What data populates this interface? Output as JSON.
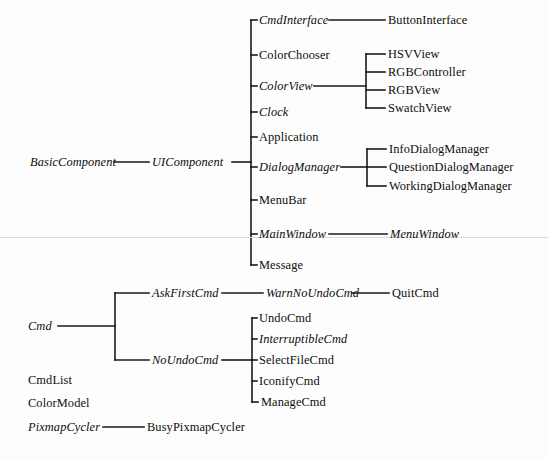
{
  "diagram": {
    "line_color": "#1a1a1a",
    "text_color": "#0d0d0d",
    "background": "#fdfdfd",
    "artifact_line_color": "#d9d9d9"
  },
  "nodes": {
    "basic_component": {
      "label": "BasicComponent",
      "style": "abstract",
      "x": 30,
      "y": 162
    },
    "ui_component": {
      "label": "UIComponent",
      "style": "abstract",
      "x": 152,
      "y": 162
    },
    "cmd_interface": {
      "label": "CmdInterface",
      "style": "abstract",
      "x": 259,
      "y": 20
    },
    "button_interface": {
      "label": "ButtonInterface",
      "style": "concrete",
      "x": 388,
      "y": 20
    },
    "color_chooser": {
      "label": "ColorChooser",
      "style": "concrete",
      "x": 259,
      "y": 55
    },
    "color_view": {
      "label": "ColorView",
      "style": "abstract",
      "x": 259,
      "y": 86
    },
    "hsv_view": {
      "label": "HSVView",
      "style": "concrete",
      "x": 388,
      "y": 54
    },
    "rgb_controller": {
      "label": "RGBController",
      "style": "concrete",
      "x": 388,
      "y": 72
    },
    "rgb_view": {
      "label": "RGBView",
      "style": "concrete",
      "x": 388,
      "y": 90
    },
    "swatch_view": {
      "label": "SwatchView",
      "style": "concrete",
      "x": 388,
      "y": 108
    },
    "clock": {
      "label": "Clock",
      "style": "abstract",
      "x": 259,
      "y": 112
    },
    "application": {
      "label": "Application",
      "style": "concrete",
      "x": 259,
      "y": 137
    },
    "dialog_manager": {
      "label": "DialogManager",
      "style": "abstract",
      "x": 259,
      "y": 167
    },
    "info_dialog_manager": {
      "label": "InfoDialogManager",
      "style": "concrete",
      "x": 389,
      "y": 149
    },
    "question_dialog_manager": {
      "label": "QuestionDialogManager",
      "style": "concrete",
      "x": 389,
      "y": 167
    },
    "working_dialog_manager": {
      "label": "WorkingDialogManager",
      "style": "concrete",
      "x": 389,
      "y": 186
    },
    "menu_bar": {
      "label": "MenuBar",
      "style": "concrete",
      "x": 259,
      "y": 200
    },
    "main_window": {
      "label": "MainWindow",
      "style": "abstract",
      "x": 259,
      "y": 234
    },
    "menu_window": {
      "label": "MenuWindow",
      "style": "abstract",
      "x": 390,
      "y": 234
    },
    "message": {
      "label": "Message",
      "style": "concrete",
      "x": 259,
      "y": 265
    },
    "cmd": {
      "label": "Cmd",
      "style": "abstract",
      "x": 28,
      "y": 326
    },
    "ask_first_cmd": {
      "label": "AskFirstCmd",
      "style": "abstract",
      "x": 152,
      "y": 293
    },
    "warn_no_undo_cmd": {
      "label": "WarnNoUndoCmd",
      "style": "abstract",
      "x": 266,
      "y": 293
    },
    "quit_cmd": {
      "label": "QuitCmd",
      "style": "concrete",
      "x": 392,
      "y": 293
    },
    "no_undo_cmd": {
      "label": "NoUndoCmd",
      "style": "abstract",
      "x": 152,
      "y": 360
    },
    "undo_cmd": {
      "label": "UndoCmd",
      "style": "concrete",
      "x": 259,
      "y": 318
    },
    "interruptible_cmd": {
      "label": "InterruptibleCmd",
      "style": "abstract",
      "x": 259,
      "y": 339
    },
    "select_file_cmd": {
      "label": "SelectFileCmd",
      "style": "concrete",
      "x": 259,
      "y": 360
    },
    "iconify_cmd": {
      "label": "IconifyCmd",
      "style": "concrete",
      "x": 259,
      "y": 381
    },
    "manage_cmd": {
      "label": "ManageCmd",
      "style": "concrete",
      "x": 261,
      "y": 402
    },
    "cmd_list": {
      "label": "CmdList",
      "style": "concrete",
      "x": 28,
      "y": 380
    },
    "color_model": {
      "label": "ColorModel",
      "style": "concrete",
      "x": 28,
      "y": 403
    },
    "pixmap_cycler": {
      "label": "PixmapCycler",
      "style": "abstract",
      "x": 28,
      "y": 427
    },
    "busy_pixmap_cycler": {
      "label": "BusyPixmapCycler",
      "style": "concrete",
      "x": 147,
      "y": 427
    }
  }
}
